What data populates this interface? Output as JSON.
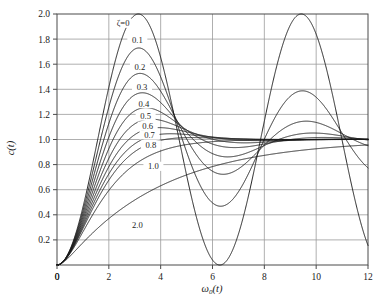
{
  "chart_data": {
    "type": "line",
    "title": "",
    "xlabel": "ω₀(t)",
    "ylabel": "c(t)",
    "xlim": [
      0,
      12
    ],
    "ylim": [
      0,
      2.0
    ],
    "xticks": [
      0,
      2,
      4,
      6,
      8,
      10,
      12
    ],
    "xtick_labels": [
      "0",
      "2",
      "4",
      "6",
      "8",
      "10",
      "12"
    ],
    "yticks": [
      0,
      0.2,
      0.4,
      0.6,
      0.8,
      1.0,
      1.2,
      1.4,
      1.6,
      1.8,
      2.0
    ],
    "ytick_labels": [
      "",
      "0.2",
      "0.4",
      "0.6",
      "0.8",
      "1.0",
      "1.2",
      "1.4",
      "1.6",
      "1.8",
      "2.0"
    ],
    "grid": true,
    "legend_position": "inline-annotations",
    "series_parameter": "ζ",
    "series": [
      {
        "name": "ζ=0",
        "zeta": 0.0,
        "label": "ζ=0",
        "label_x": 2.55,
        "label_y": 1.92,
        "peak": {
          "x": 3.14,
          "y": 2.0
        },
        "trough": {
          "x": 6.28,
          "y": 0.0
        },
        "second_peak": {
          "x": 9.42,
          "y": 2.0
        }
      },
      {
        "name": "0.1",
        "zeta": 0.1,
        "label": "0.1",
        "label_x": 3.1,
        "label_y": 1.79,
        "peak": {
          "x": 3.16,
          "y": 1.73
        },
        "trough": {
          "x": 6.31,
          "y": 0.73
        },
        "second_peak": {
          "x": 9.47,
          "y": 1.4
        }
      },
      {
        "name": "0.2",
        "zeta": 0.2,
        "label": "0.2",
        "label_x": 3.2,
        "label_y": 1.57,
        "peak": {
          "x": 3.21,
          "y": 1.53
        },
        "trough": {
          "x": 6.41,
          "y": 0.86
        },
        "second_peak": {
          "x": 9.62,
          "y": 1.15
        }
      },
      {
        "name": "0.3",
        "zeta": 0.3,
        "label": "0.3",
        "label_x": 3.28,
        "label_y": 1.41,
        "peak": {
          "x": 3.29,
          "y": 1.37
        },
        "trough": {
          "x": 6.59,
          "y": 0.93
        },
        "second_peak": {
          "x": 9.88,
          "y": 1.05
        }
      },
      {
        "name": "0.4",
        "zeta": 0.4,
        "label": "0.4",
        "label_x": 3.35,
        "label_y": 1.28,
        "peak": {
          "x": 3.43,
          "y": 1.25
        },
        "trough": {
          "x": 6.86,
          "y": 0.97
        },
        "second_peak": {
          "x": 10.3,
          "y": 1.01
        }
      },
      {
        "name": "0.5",
        "zeta": 0.5,
        "label": "0.5",
        "label_x": 3.42,
        "label_y": 1.18,
        "peak": {
          "x": 3.63,
          "y": 1.16
        },
        "trough": {
          "x": 7.26,
          "y": 0.99
        },
        "second_peak": {
          "x": 10.9,
          "y": 1.0
        }
      },
      {
        "name": "0.6",
        "zeta": 0.6,
        "label": "0.6",
        "label_x": 3.5,
        "label_y": 1.1,
        "peak": {
          "x": 3.93,
          "y": 1.09
        },
        "trough": {
          "x": 7.85,
          "y": 1.0
        },
        "second_peak": null
      },
      {
        "name": "0.7",
        "zeta": 0.7,
        "label": "0.7",
        "label_x": 3.57,
        "label_y": 1.03,
        "peak": {
          "x": 4.4,
          "y": 1.05
        },
        "trough": {
          "x": 8.8,
          "y": 1.0
        },
        "second_peak": null
      },
      {
        "name": "0.8",
        "zeta": 0.8,
        "label": "0.8",
        "label_x": 3.62,
        "label_y": 0.95,
        "peak": {
          "x": 5.24,
          "y": 1.02
        },
        "trough": null,
        "second_peak": null
      },
      {
        "name": "1.0",
        "zeta": 1.0,
        "label": "1.0",
        "label_x": 3.72,
        "label_y": 0.78,
        "peak": null,
        "trough": null,
        "second_peak": null
      },
      {
        "name": "2.0",
        "zeta": 2.0,
        "label": "2.0",
        "label_x": 3.1,
        "label_y": 0.31,
        "peak": null,
        "trough": null,
        "second_peak": null
      }
    ],
    "formula": "c(t)=1-exp(-z*T)*(cos(wd*T)+z/sqrt(1-z*z)*sin(wd*T)), T=omega0*t",
    "steady_state": 1.0
  },
  "style": {
    "curve_color": "#1a1a1a",
    "grid_color": "#9a9a9a",
    "axis_color": "#4a4a4a",
    "background": "#ffffff",
    "text_color": "#1a1a1a"
  },
  "plot_box": {
    "left": 57,
    "top": 14,
    "right": 368,
    "bottom": 265
  }
}
